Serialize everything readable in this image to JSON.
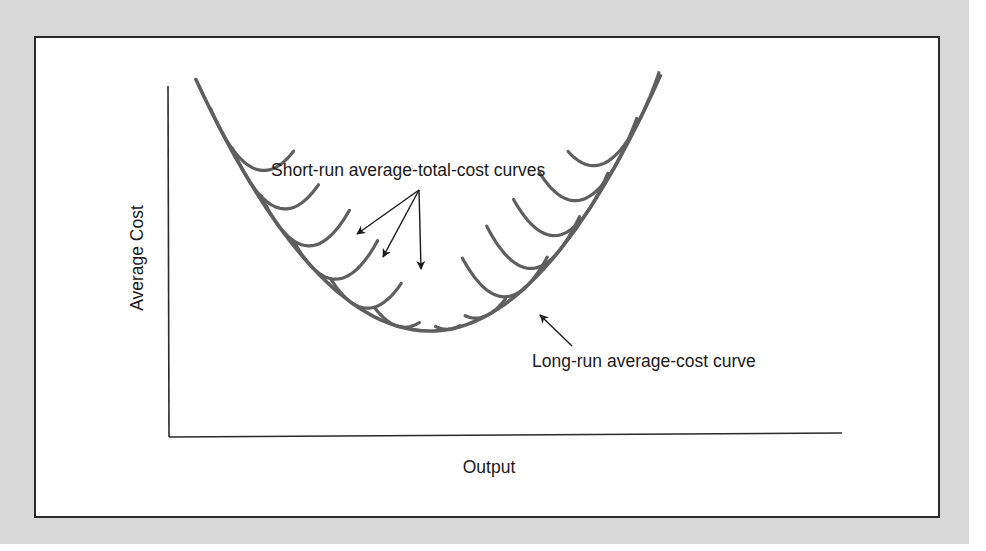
{
  "figure": {
    "y_axis_label": "Average Cost",
    "x_axis_label": "Output",
    "annotations": {
      "short_run": "Short-run average-total-cost curves",
      "long_run": "Long-run average-cost curve"
    },
    "colors": {
      "curve": "#5f5f5f",
      "axis": "#2a2a2a",
      "arrow": "#1a1a1a",
      "backdrop": "#d8d8d8"
    }
  },
  "chart_data": {
    "type": "line",
    "title": "",
    "xlabel": "Output",
    "ylabel": "Average Cost",
    "xlim": [
      0,
      100
    ],
    "ylim": [
      0,
      100
    ],
    "grid": false,
    "ticks": "none",
    "long_run_curve": {
      "name": "Long-run average-cost curve",
      "min_output": 38.8,
      "min_cost": 30.1,
      "left_curvature": 0.059,
      "right_curvature": 0.062,
      "output_range": [
        4,
        73
      ]
    },
    "short_run_curves": [
      {
        "name": "SRATC 1",
        "tangent_output": 7.5,
        "range": [
          6.2,
          18.5
        ]
      },
      {
        "name": "SRATC 2",
        "tangent_output": 11.5,
        "range": [
          9.4,
          22.2
        ]
      },
      {
        "name": "SRATC 3",
        "tangent_output": 16.0,
        "range": [
          13.7,
          26.8
        ]
      },
      {
        "name": "SRATC 4",
        "tangent_output": 21.0,
        "range": [
          18.6,
          31.0
        ]
      },
      {
        "name": "SRATC 5",
        "tangent_output": 27.0,
        "range": [
          24.0,
          34.5
        ]
      },
      {
        "name": "SRATC 6",
        "tangent_output": 34.0,
        "range": [
          30.5,
          37.2
        ]
      },
      {
        "name": "SRATC 7",
        "tangent_output": 42.0,
        "range": [
          39.6,
          43.2
        ]
      },
      {
        "name": "SRATC 8",
        "tangent_output": 47.5,
        "range": [
          44.0,
          50.0
        ]
      },
      {
        "name": "SRATC 9",
        "tangent_output": 53.0,
        "range": [
          43.6,
          56.2
        ]
      },
      {
        "name": "SRATC 10",
        "tangent_output": 58.0,
        "range": [
          47.2,
          61.0
        ]
      },
      {
        "name": "SRATC 11",
        "tangent_output": 62.5,
        "range": [
          51.2,
          65.2
        ]
      },
      {
        "name": "SRATC 12",
        "tangent_output": 66.5,
        "range": [
          55.0,
          69.5
        ]
      },
      {
        "name": "SRATC 13",
        "tangent_output": 70.0,
        "range": [
          59.3,
          72.8
        ]
      }
    ]
  }
}
